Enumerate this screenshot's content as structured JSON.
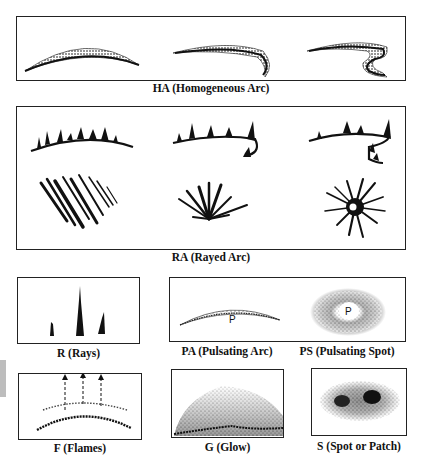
{
  "figure": {
    "panels": [
      {
        "id": "HA",
        "label": "HA (Homogeneous Arc)"
      },
      {
        "id": "RA",
        "label": "RA (Rayed Arc)"
      },
      {
        "id": "R",
        "label": "R (Rays)"
      },
      {
        "id": "PA",
        "label": "PA (Pulsating Arc)",
        "marker": "P"
      },
      {
        "id": "PS",
        "label": "PS (Pulsating Spot)",
        "marker": "P"
      },
      {
        "id": "F",
        "label": "F (Flames)"
      },
      {
        "id": "G",
        "label": "G (Glow)"
      },
      {
        "id": "S",
        "label": "S (Spot or Patch)"
      }
    ]
  }
}
